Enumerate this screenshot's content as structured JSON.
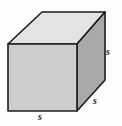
{
  "figure": {
    "name": "cube-diagram",
    "background_color": "#fefefe",
    "canvas": {
      "width": 122,
      "height": 126
    }
  },
  "cube": {
    "edge_color": "#1c1c1c",
    "edge_width": 1.6,
    "faces": {
      "front": {
        "name": "front-face",
        "fill": "#cdcdcd",
        "points": "8,44 77,44 77,111 8,111"
      },
      "top": {
        "name": "top-face",
        "fill": "#e3e3e3",
        "points": "8,44 42,12 105,12 77,44"
      },
      "right": {
        "name": "right-face",
        "fill": "#a9a9a9",
        "points": "77,44 105,12 105,80 77,111"
      }
    },
    "hidden_edges": false
  },
  "labels": {
    "right_edge": "s",
    "depth_edge": "s",
    "front_edge": "s"
  }
}
